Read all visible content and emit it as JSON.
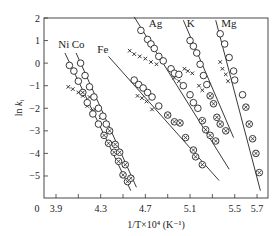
{
  "chart_data": {
    "type": "scatter",
    "title": "",
    "xlabel": "1/T×10⁴ (K⁻¹)",
    "ylabel": "ln k_i",
    "xlim": [
      3.8,
      5.8
    ],
    "ylim": [
      -5.8,
      2
    ],
    "grid": false,
    "legend": "inline labels near lines",
    "x_ticks": [
      3.9,
      4.3,
      4.7,
      5.1,
      5.5,
      5.7
    ],
    "x_tick_labels": [
      "0",
      "3.9",
      "4.3",
      "4.7",
      "5.1",
      "5.5",
      "5.7"
    ],
    "y_ticks": [
      2,
      1,
      0,
      -1,
      -2,
      -3,
      -4,
      -5
    ],
    "y_tick_labels": [
      "2",
      "1",
      "0",
      "−1",
      "−2",
      "−3",
      "−4",
      "−5"
    ],
    "marker_legend": {
      "open_circle": "data points (upper region)",
      "crossed_circle": "data points (lower region)",
      "cross": "scattered points off fitted line"
    },
    "series": [
      {
        "name": "Ni",
        "label_pos": [
          3.92,
          0.65
        ],
        "line": [
          [
            3.98,
            0.45
          ],
          [
            4.57,
            -5.65
          ]
        ],
        "circles": [
          [
            4.02,
            -0.1
          ],
          [
            4.06,
            -0.35
          ],
          [
            4.1,
            -0.8
          ],
          [
            4.14,
            -1.3
          ],
          [
            4.18,
            -1.75
          ],
          [
            4.23,
            -2.25
          ],
          [
            4.28,
            -2.7
          ]
        ],
        "crossed": [
          [
            4.33,
            -3.2
          ],
          [
            4.37,
            -3.55
          ],
          [
            4.42,
            -3.95
          ],
          [
            4.46,
            -4.35
          ],
          [
            4.5,
            -4.95
          ],
          [
            4.54,
            -5.25
          ]
        ],
        "crosses": [
          [
            4.01,
            -1.05
          ],
          [
            4.05,
            -1.15
          ],
          [
            4.1,
            -1.3
          ],
          [
            4.14,
            -1.45
          ],
          [
            4.18,
            -1.9
          ],
          [
            4.22,
            -2.1
          ]
        ]
      },
      {
        "name": "Co",
        "label_pos": [
          4.04,
          0.65
        ],
        "line": [
          [
            4.08,
            0.45
          ],
          [
            4.62,
            -5.5
          ]
        ],
        "circles": [
          [
            4.12,
            0.0
          ],
          [
            4.16,
            -0.55
          ],
          [
            4.2,
            -1.05
          ],
          [
            4.24,
            -1.5
          ],
          [
            4.28,
            -2.0
          ],
          [
            4.32,
            -2.35
          ],
          [
            4.35,
            -2.7
          ]
        ],
        "crossed": [
          [
            4.38,
            -3.0
          ],
          [
            4.43,
            -3.6
          ],
          [
            4.47,
            -3.95
          ],
          [
            4.52,
            -4.5
          ],
          [
            4.57,
            -5.1
          ]
        ],
        "crosses": [
          [
            4.14,
            -1.3
          ],
          [
            4.2,
            -1.5
          ],
          [
            4.25,
            -2.05
          ],
          [
            4.3,
            -2.4
          ]
        ]
      },
      {
        "name": "Fe",
        "label_pos": [
          4.27,
          0.45
        ],
        "line": [
          [
            4.37,
            0.3
          ],
          [
            5.36,
            -5.2
          ]
        ],
        "circles": [
          [
            4.6,
            -0.75
          ],
          [
            4.64,
            -0.95
          ],
          [
            4.68,
            -1.1
          ],
          [
            4.72,
            -1.3
          ],
          [
            4.76,
            -1.5
          ],
          [
            4.82,
            -1.9
          ]
        ],
        "crossed": [
          [
            4.9,
            -2.3
          ],
          [
            4.96,
            -2.6
          ],
          [
            5.01,
            -2.65
          ],
          [
            5.06,
            -3.3
          ],
          [
            5.13,
            -3.85
          ],
          [
            5.15,
            -4.15
          ],
          [
            5.21,
            -4.5
          ]
        ],
        "crosses": [
          [
            4.56,
            0.55
          ],
          [
            4.6,
            0.4
          ],
          [
            4.65,
            0.3
          ],
          [
            4.7,
            0.2
          ],
          [
            4.75,
            0.05
          ],
          [
            4.8,
            -0.05
          ],
          [
            4.63,
            -1.45
          ],
          [
            4.67,
            -1.55
          ],
          [
            4.71,
            -1.7
          ],
          [
            4.76,
            -2.05
          ]
        ]
      },
      {
        "name": "Ag",
        "label_pos": [
          4.73,
          1.6
        ],
        "line": [
          [
            4.6,
            2.05
          ],
          [
            5.45,
            -4.7
          ]
        ],
        "circles": [
          [
            4.66,
            1.45
          ],
          [
            4.72,
            1.05
          ],
          [
            4.75,
            0.85
          ],
          [
            4.78,
            0.65
          ],
          [
            4.82,
            0.3
          ],
          [
            4.86,
            0.1
          ],
          [
            4.93,
            -0.25
          ],
          [
            4.96,
            -0.45
          ],
          [
            5.0,
            -0.5
          ],
          [
            5.04,
            -1.0
          ],
          [
            5.1,
            -1.4
          ],
          [
            5.13,
            -1.75
          ],
          [
            5.17,
            -2.0
          ]
        ],
        "crossed": [
          [
            5.21,
            -2.55
          ],
          [
            5.24,
            -2.95
          ],
          [
            5.28,
            -3.2
          ],
          [
            5.33,
            -3.45
          ]
        ],
        "crosses": [
          [
            4.96,
            -0.65
          ],
          [
            5.0,
            -0.8
          ]
        ]
      },
      {
        "name": "K",
        "label_pos": [
          5.07,
          1.6
        ],
        "line": [
          [
            5.04,
            1.9
          ],
          [
            5.49,
            -3.3
          ]
        ],
        "circles": [
          [
            5.1,
            1.0
          ],
          [
            5.13,
            0.75
          ],
          [
            5.16,
            0.45
          ],
          [
            5.19,
            -0.05
          ],
          [
            5.22,
            -0.55
          ],
          [
            5.25,
            -0.95
          ]
        ],
        "crossed": [
          [
            5.28,
            -1.45
          ],
          [
            5.31,
            -1.8
          ],
          [
            5.34,
            -2.4
          ],
          [
            5.37,
            -2.7
          ],
          [
            5.42,
            -3.0
          ]
        ],
        "crosses": [
          [
            5.05,
            -0.25
          ],
          [
            5.08,
            -0.35
          ],
          [
            5.12,
            -0.45
          ],
          [
            5.18,
            -1.0
          ],
          [
            5.21,
            -1.2
          ]
        ]
      },
      {
        "name": "Mg",
        "label_pos": [
          5.38,
          1.6
        ],
        "line": [
          [
            5.33,
            1.9
          ],
          [
            5.73,
            -5.65
          ]
        ],
        "circles": [
          [
            5.37,
            1.3
          ],
          [
            5.41,
            0.85
          ],
          [
            5.45,
            0.25
          ],
          [
            5.49,
            -0.35
          ],
          [
            5.5,
            -0.75
          ],
          [
            5.57,
            -1.4
          ]
        ],
        "crossed": [
          [
            5.6,
            -1.95
          ],
          [
            5.63,
            -2.7
          ],
          [
            5.66,
            -3.35
          ],
          [
            5.69,
            -4.0
          ],
          [
            5.72,
            -4.85
          ]
        ],
        "crosses": [
          [
            5.37,
            0.05
          ],
          [
            5.39,
            -0.25
          ],
          [
            5.42,
            -0.5
          ],
          [
            5.44,
            -0.8
          ]
        ]
      }
    ]
  }
}
